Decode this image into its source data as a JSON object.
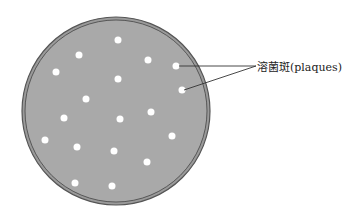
{
  "diagram": {
    "label": "溶菌斑(plaques)",
    "colors": {
      "agar": "#a9a9a9",
      "rim": "#555555",
      "plaque": "#ffffff",
      "line": "#333333"
    },
    "dish": {
      "cx": 116,
      "cy": 111,
      "r_outer": 94,
      "r_inner": 91
    },
    "plaques": [
      {
        "x": 118,
        "y": 40
      },
      {
        "x": 79,
        "y": 55
      },
      {
        "x": 148,
        "y": 60
      },
      {
        "x": 176,
        "y": 66
      },
      {
        "x": 56,
        "y": 72
      },
      {
        "x": 118,
        "y": 79
      },
      {
        "x": 182,
        "y": 90
      },
      {
        "x": 86,
        "y": 99
      },
      {
        "x": 64,
        "y": 118
      },
      {
        "x": 120,
        "y": 119
      },
      {
        "x": 151,
        "y": 112
      },
      {
        "x": 45,
        "y": 140
      },
      {
        "x": 77,
        "y": 147
      },
      {
        "x": 114,
        "y": 151
      },
      {
        "x": 172,
        "y": 136
      },
      {
        "x": 147,
        "y": 162
      },
      {
        "x": 75,
        "y": 183
      },
      {
        "x": 112,
        "y": 186
      }
    ],
    "pointers": [
      {
        "x1": 179,
        "y1": 66,
        "x2": 256,
        "y2": 66
      },
      {
        "x1": 184,
        "y1": 90,
        "x2": 256,
        "y2": 66
      }
    ]
  }
}
